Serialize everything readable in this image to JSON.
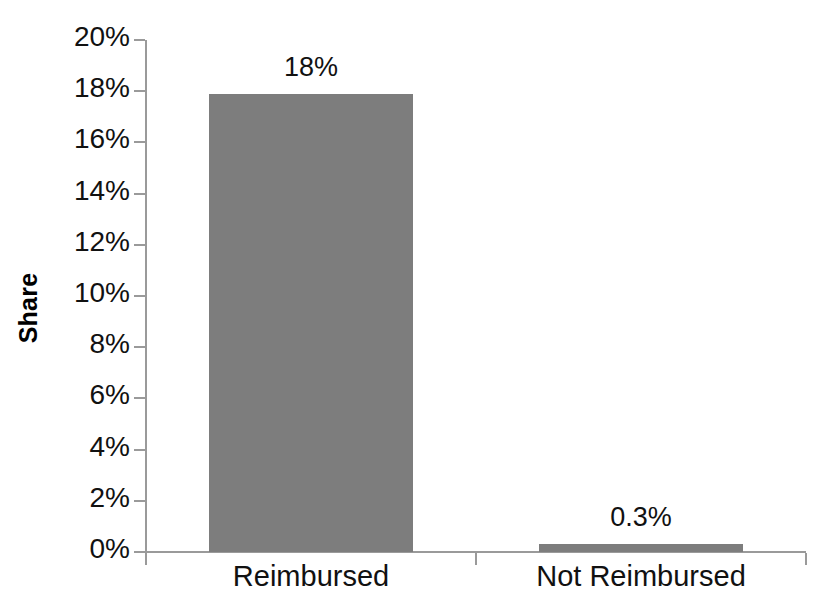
{
  "chart_data": {
    "type": "bar",
    "title": "",
    "subtitle": "",
    "xlabel": "",
    "ylabel": "Share",
    "categories": [
      "Reimbursed",
      "Not Reimbursed"
    ],
    "values": [
      17.9,
      0.3
    ],
    "data_labels": [
      "18%",
      "0.3%"
    ],
    "ylim": [
      0,
      20
    ],
    "ytick_values": [
      0,
      2,
      4,
      6,
      8,
      10,
      12,
      14,
      16,
      18,
      20
    ],
    "ytick_labels": [
      "0%",
      "2%",
      "4%",
      "6%",
      "8%",
      "10%",
      "12%",
      "14%",
      "16%",
      "18%",
      "20%"
    ],
    "grid": false,
    "legend": false,
    "legend_position": "none",
    "series": [
      {
        "name": "Share",
        "values": [
          17.9,
          0.3
        ],
        "color": "#7d7d7d"
      }
    ]
  },
  "axes": {
    "y_title": "Share",
    "tick_color": "#9a9a9a",
    "axis_color": "#9a9a9a",
    "text_color": "#111111"
  },
  "colors": {
    "bar_fill": "#7d7d7d",
    "background": "#ffffff",
    "axis": "#9a9a9a",
    "text": "#111111"
  }
}
